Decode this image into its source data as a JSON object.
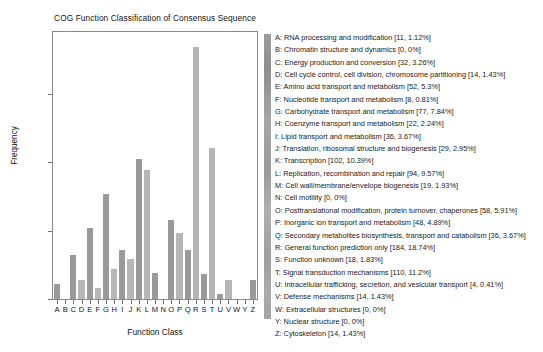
{
  "chart_data": {
    "type": "bar",
    "title": "COG Function Classification of Consensus Sequence",
    "xlabel": "Function Class",
    "ylabel": "Frequency",
    "categories": [
      "A",
      "B",
      "C",
      "D",
      "E",
      "F",
      "G",
      "H",
      "I",
      "J",
      "K",
      "L",
      "M",
      "N",
      "O",
      "P",
      "Q",
      "R",
      "S",
      "T",
      "U",
      "V",
      "W",
      "Y",
      "Z"
    ],
    "values": [
      11,
      0,
      32,
      14,
      52,
      8,
      77,
      22,
      36,
      29,
      102,
      94,
      19,
      0,
      58,
      48,
      36,
      184,
      18,
      110,
      4,
      14,
      0,
      0,
      14
    ],
    "percents": [
      "1.12%",
      "0%",
      "3.26%",
      "1.43%",
      "5.3%",
      "0.81%",
      "7.84%",
      "2.24%",
      "3.67%",
      "2.95%",
      "10.39%",
      "9.57%",
      "1.93%",
      "0.0%",
      "5.91%",
      "4.89%",
      "3.67%",
      "18.74%",
      "1.83%",
      "11.2%",
      "0.41%",
      "1.43%",
      "0%",
      "0.0%",
      "1.43%"
    ],
    "ylim": [
      0,
      195
    ],
    "yticks": [
      0,
      50,
      100,
      150
    ],
    "ytick_labels": [
      "0",
      "50",
      "100",
      "150"
    ],
    "grid": false,
    "legend_position": "right",
    "bar_colors": [
      "#9a9a9a",
      "#b6b6b6"
    ]
  },
  "legend": {
    "items": [
      "A: RNA processing and modification [11, 1.12%]",
      "B: Chromatin structure and dynamics [0, 0%]",
      "C: Energy production and conversion [32, 3.26%]",
      "D: Cell cycle control, cell division, chromosome partitioning [14, 1.43%]",
      "E: Amino acid transport and metabolism [52, 5.3%]",
      "F: Nucleotide transport and metabolism [8, 0.81%]",
      "G: Carbohydrate transport and metabolism [77, 7.84%]",
      "H: Coenzyme transport and metabolism [22, 2.24%]",
      "I: Lipid transport and metabolism [36, 3.67%]",
      "J: Translation, ribosomal structure and biogenesis [29, 2.95%]",
      "K: Transcription [102, 10.39%]",
      "L: Replication, recombination and repair [94, 9.57%]",
      "M: Cell wall/membrane/envelope biogenesis [19, 1.93%]",
      "N: Cell motility [0, 0%]",
      "O: Posttranslational modification, protein turnover, chaperones [58, 5.91%]",
      "P: Inorganic ion transport and metabolism [48, 4.89%]",
      "Q: Secondary metabolites biosynthesis, transport and catabolism [36, 3.67%]",
      "R: General function prediction only [184, 18.74%]",
      "S: Function unknown [18, 1.83%]",
      "T: Signal transduction mechanisms [110, 11.2%]",
      "U: Intracellular trafficking, secretion, and vesicular transport [4, 0.41%]",
      "V: Defense mechanisms [14, 1.43%]",
      "W: Extracellular structures [0, 0%]",
      "Y: Nuclear structure [0, 0%]",
      "Z: Cytoskeleton [14, 1.43%]"
    ]
  }
}
